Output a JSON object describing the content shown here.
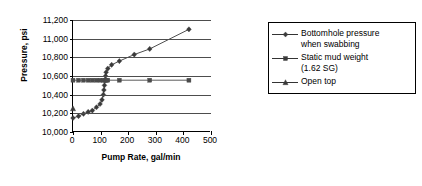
{
  "chart_data": {
    "type": "scatter",
    "title": "",
    "xlabel": "Pump Rate, gal/min",
    "ylabel": "Pressure, psi",
    "xlim": [
      0,
      500
    ],
    "ylim": [
      10000,
      11200
    ],
    "xticks": [
      0,
      100,
      200,
      300,
      400,
      500
    ],
    "xtick_labels": [
      "0",
      "100",
      "200",
      "300",
      "400",
      "500"
    ],
    "yticks": [
      10000,
      10200,
      10400,
      10600,
      10800,
      11000,
      11200
    ],
    "ytick_labels": [
      "10,000",
      "10,200",
      "10,400",
      "10,600",
      "10,800",
      "11,000",
      "11,200"
    ],
    "grid": "horizontal",
    "legend_position": "right",
    "series": [
      {
        "name": "Bottomhole pressure when swabbing",
        "marker": "diamond",
        "color": "#3a3a3a",
        "points": [
          [
            0,
            10150
          ],
          [
            20,
            10170
          ],
          [
            38,
            10195
          ],
          [
            55,
            10215
          ],
          [
            70,
            10230
          ],
          [
            85,
            10265
          ],
          [
            98,
            10300
          ],
          [
            105,
            10345
          ],
          [
            110,
            10400
          ],
          [
            112,
            10450
          ],
          [
            114,
            10500
          ],
          [
            116,
            10555
          ],
          [
            118,
            10600
          ],
          [
            120,
            10640
          ],
          [
            126,
            10680
          ],
          [
            140,
            10720
          ],
          [
            168,
            10760
          ],
          [
            222,
            10830
          ],
          [
            278,
            10890
          ],
          [
            420,
            11100
          ]
        ]
      },
      {
        "name": "Static mud weight (1.62 SG)",
        "marker": "square",
        "color": "#4a4a4a",
        "constant_value": 10555,
        "points": [
          [
            0,
            10555
          ],
          [
            20,
            10555
          ],
          [
            38,
            10555
          ],
          [
            55,
            10555
          ],
          [
            70,
            10555
          ],
          [
            85,
            10555
          ],
          [
            98,
            10555
          ],
          [
            110,
            10555
          ],
          [
            116,
            10555
          ],
          [
            120,
            10555
          ],
          [
            126,
            10555
          ],
          [
            168,
            10555
          ],
          [
            278,
            10555
          ],
          [
            420,
            10555
          ]
        ]
      },
      {
        "name": "Open top",
        "marker": "triangle",
        "color": "#3a3a3a",
        "points": [
          [
            0,
            10250
          ]
        ]
      }
    ]
  },
  "legend": {
    "items": [
      {
        "label": "Bottomhole pressure\nwhen swabbing",
        "marker": "diamond"
      },
      {
        "label": "Static mud weight\n(1.62 SG)",
        "marker": "square"
      },
      {
        "label": "Open top",
        "marker": "triangle"
      }
    ]
  }
}
